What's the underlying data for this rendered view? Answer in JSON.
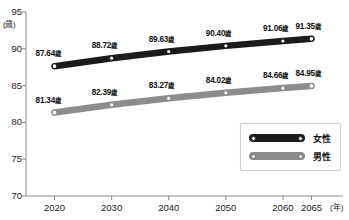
{
  "chart_data": {
    "type": "line",
    "title": "",
    "xlabel": "(年)",
    "ylabel": "(歳)",
    "ylim": [
      70,
      95
    ],
    "xlim": [
      2015,
      2070
    ],
    "grid": false,
    "legend_position": "bottom-right",
    "categories": [
      "2020",
      "2030",
      "2040",
      "2050",
      "2060",
      "2065"
    ],
    "x": [
      2020,
      2030,
      2040,
      2050,
      2060,
      2065
    ],
    "yticks": [
      "70",
      "75",
      "80",
      "85",
      "90",
      "95"
    ],
    "ytick_values": [
      70,
      75,
      80,
      85,
      90,
      95
    ],
    "series": [
      {
        "name": "女性",
        "color": "#1b1b1b",
        "values": [
          87.64,
          88.72,
          89.63,
          90.4,
          91.06,
          91.35
        ],
        "labels": [
          "87.64歳",
          "88.72歳",
          "89.63歳",
          "90.40歳",
          "91.06歳",
          "91.35歳"
        ]
      },
      {
        "name": "男性",
        "color": "#8c8c8c",
        "values": [
          81.34,
          82.39,
          83.27,
          84.02,
          84.66,
          84.95
        ],
        "labels": [
          "81.34歳",
          "82.39歳",
          "83.27歳",
          "84.02歳",
          "84.66歳",
          "84.95歳"
        ]
      }
    ]
  },
  "axis": {
    "unit_y": "(歳)",
    "unit_x": "(年)"
  },
  "legend": {
    "items": [
      {
        "label": "女性"
      },
      {
        "label": "男性"
      }
    ]
  },
  "point_labels": {
    "female": [
      {
        "num": "87.64",
        "unit": "歳"
      },
      {
        "num": "88.72",
        "unit": "歳"
      },
      {
        "num": "89.63",
        "unit": "歳"
      },
      {
        "num": "90.40",
        "unit": "歳"
      },
      {
        "num": "91.06",
        "unit": "歳"
      },
      {
        "num": "91.35",
        "unit": "歳"
      }
    ],
    "male": [
      {
        "num": "81.34",
        "unit": "歳"
      },
      {
        "num": "82.39",
        "unit": "歳"
      },
      {
        "num": "83.27",
        "unit": "歳"
      },
      {
        "num": "84.02",
        "unit": "歳"
      },
      {
        "num": "84.66",
        "unit": "歳"
      },
      {
        "num": "84.95",
        "unit": "歳"
      }
    ]
  },
  "ticks": {
    "y": [
      "95",
      "90",
      "85",
      "80",
      "75",
      "70"
    ],
    "x": [
      "2020",
      "2030",
      "2040",
      "2050",
      "2060",
      "2065"
    ]
  },
  "colors": {
    "female_line": "#1b1b1b",
    "male_line": "#8c8c8c",
    "axis": "#8a8a8a",
    "text": "#1a1a1a",
    "background": "#ffffff"
  }
}
